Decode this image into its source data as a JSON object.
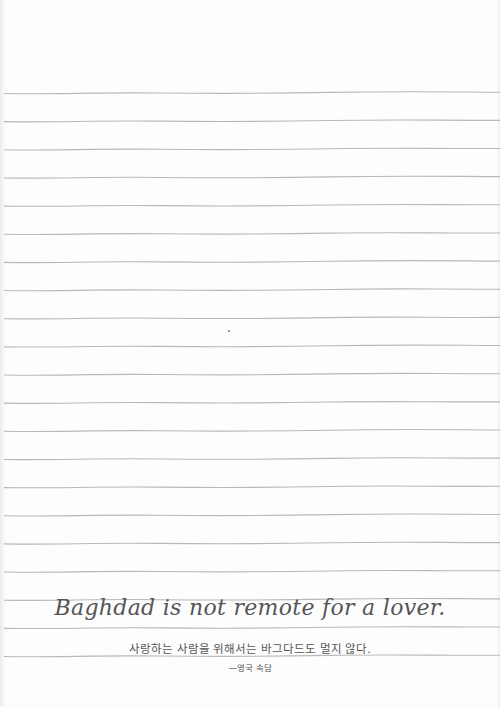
{
  "page": {
    "line_count": 21,
    "line_color": "#b8b8b8",
    "background": "#fdfdfd"
  },
  "quote": {
    "english": "Baghdad is not remote for a lover.",
    "korean": "사랑하는 사람을 위해서는 바그다드도 멀지 않다.",
    "attribution": "—영국 속담"
  }
}
